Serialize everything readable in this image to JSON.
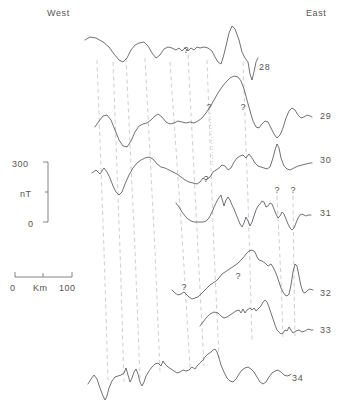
{
  "figure": {
    "type": "magnetic-anomaly-profiles",
    "orientation": {
      "west_label": "West",
      "east_label": "East"
    },
    "vertical_scale": {
      "top_value": "300",
      "unit_label": "nT",
      "bottom_value": "0"
    },
    "horizontal_scale": {
      "left_value": "0",
      "unit_label": "Km",
      "right_value": "100"
    },
    "colors": {
      "trace": "#4d4d55",
      "correlation_line": "#c2c2c2",
      "text": "#555555",
      "background": "#ffffff"
    },
    "profiles": [
      {
        "label": "28",
        "label_x": 259,
        "label_y": 62
      },
      {
        "label": "29",
        "label_x": 320,
        "label_y": 111
      },
      {
        "label": "30",
        "label_x": 320,
        "label_y": 155
      },
      {
        "label": "31",
        "label_x": 320,
        "label_y": 208
      },
      {
        "label": "32",
        "label_x": 320,
        "label_y": 288
      },
      {
        "label": "33",
        "label_x": 320,
        "label_y": 325
      },
      {
        "label": "34",
        "label_x": 292,
        "label_y": 373
      }
    ],
    "uncertainty_markers": [
      {
        "profile": "28",
        "x": 186,
        "y": 53
      },
      {
        "profile": "29",
        "x": 209,
        "y": 110
      },
      {
        "profile": "29",
        "x": 243,
        "y": 110
      },
      {
        "profile": "30",
        "x": 206,
        "y": 182
      },
      {
        "profile": "31",
        "x": 277,
        "y": 193
      },
      {
        "profile": "31",
        "x": 293,
        "y": 193
      },
      {
        "profile": "32",
        "x": 184,
        "y": 290
      },
      {
        "profile": "32",
        "x": 238,
        "y": 279
      }
    ]
  },
  "chart_data": {
    "type": "line",
    "title": "",
    "xlabel": "Km",
    "ylabel": "nT",
    "ylim": [
      0,
      300
    ],
    "xlim": [
      0,
      100
    ],
    "grid": false,
    "legend": "none",
    "annotations": [
      "West",
      "East",
      "?"
    ],
    "series": [
      {
        "name": "28",
        "x_start": 85,
        "x_end": 258,
        "baseline_y": 52,
        "points": "85,40 90,37 96,38 103,42 109,47 114,54 119,60 123,62 127,58 131,50 135,45 139,43 144,42 148,46 152,53 156,58 160,55 164,49 168,47 172,48 176,50 179,48 182,51 185,48 188,51 191,48 194,50 197,47 200,48 204,47 208,48 212,51 215,57 218,62 221,64 223,58 226,46 229,33 232,26 235,29 239,40 242,52 245,58 248,62 250,74 252,80 254,72 256,62 258,58"
      },
      {
        "name": "29",
        "x_start": 95,
        "x_end": 312,
        "baseline_y": 125,
        "points": "95,127 99,121 103,116 107,115 111,120 115,130 119,140 123,146 127,147 131,141 135,132 139,126 143,124 147,123 151,120 155,116 158,114 162,117 166,122 170,124 174,123 178,121 182,122 186,123 190,122 194,123 198,121 202,118 206,113 210,107 214,100 218,93 222,87 226,82 230,78 234,76 238,77 241,81 244,89 247,100 250,111 253,121 256,127 259,128 262,124 265,121 268,122 271,128 274,134 277,138 280,135 283,128 286,118 289,111 292,108 295,110 298,115 301,118 304,117 307,115 310,116 312,117"
      },
      {
        "name": "30",
        "x_start": 92,
        "x_end": 312,
        "baseline_y": 172,
        "points": "92,173 96,170 100,174 104,168 107,172 110,178 113,186 116,192 119,195 122,192 125,184 129,175 133,168 137,163 141,160 145,158 149,157 153,159 157,164 161,167 165,168 169,170 173,172 177,174 181,177 185,180 189,182 193,183 197,184 200,182 203,178 206,180 210,177 213,172 216,170 219,168 222,165 225,166 228,170 231,168 234,162 237,158 240,156 243,155 246,158 249,154 252,158 255,163 258,166 261,167 264,168 267,169 270,167 273,158 275,150 277,144 279,148 281,158 284,166 287,169 290,170 294,168 298,166 302,165 306,164 310,163 312,163"
      },
      {
        "name": "31",
        "x_start": 176,
        "x_end": 311,
        "baseline_y": 218,
        "points": "176,203 179,207 182,212 185,216 188,219 191,221 194,222 197,222 200,222 203,222 206,221 209,218 212,212 215,205 218,199 221,195 222,199 224,206 226,200 228,197 230,200 232,205 234,209 236,214 238,219 240,224 242,227 244,223 246,217 248,221 250,226 252,222 254,216 256,210 258,206 260,204 262,201 264,202 266,207 268,206 270,203 272,204 274,209 276,214 278,218 280,216 282,212 284,214 286,219 288,224 290,228 292,230 294,228 296,223 298,218 300,215 302,214 304,215 306,216 308,215 310,215 311,215"
      },
      {
        "name": "32",
        "x_start": 172,
        "x_end": 313,
        "baseline_y": 295,
        "points": "172,290 175,293 178,295 181,294 184,292 186,294 189,297 192,299 195,298 198,297 201,294 204,291 207,288 210,285 213,283 216,281 219,278 222,274 225,272 228,270 231,268 234,266 237,264 240,261 243,258 246,254 249,251 252,250 255,252 257,257 259,260 262,261 265,263 268,266 271,264 273,267 275,271 277,276 279,282 281,288 283,292 285,295 287,296 289,294 291,285 293,272 295,264 297,266 299,276 301,286 303,292 305,293 308,290 310,289 313,290"
      },
      {
        "name": "33",
        "x_start": 200,
        "x_end": 313,
        "baseline_y": 325,
        "points": "200,326 203,322 206,318 210,314 214,312 218,313 221,316 224,318 227,317 230,315 233,313 236,311 239,310 241,313 243,309 245,313 247,310 250,308 252,310 254,308 256,311 258,309 261,306 263,302 265,300 267,302 269,307 271,313 273,319 275,325 277,330 279,332 281,334 283,333 285,330 287,331 289,327 291,330 293,333 296,331 299,330 302,332 305,331 308,329 311,330 313,330"
      },
      {
        "name": "34",
        "x_start": 88,
        "x_end": 291,
        "baseline_y": 382,
        "points": "88,384 91,379 94,375 97,379 100,388 103,396 105,400 107,396 109,388 112,381 115,377 118,376 121,375 124,373 126,368 128,375 130,382 132,378 134,372 136,369 138,374 140,382 142,386 144,382 146,376 149,371 152,367 155,364 158,363 161,366 163,361 165,364 168,367 171,369 174,371 177,373 180,372 183,370 186,371 189,370 192,367 195,369 197,366 199,364 201,362 203,360 205,357 208,354 211,352 213,350 215,349 217,352 219,358 221,365 224,372 227,378 230,381 233,382 236,379 239,374 242,370 245,368 248,367 251,369 254,372 257,377 260,382 263,384 266,382 269,377 272,373 275,371 278,370 281,372 284,375 287,376 290,375 291,374"
      }
    ],
    "correlation_lines": [
      {
        "id": "c1",
        "path": "M 97,60 L 104,250 L 108,380"
      },
      {
        "id": "c2",
        "path": "M 113,62 L 120,250 L 124,382"
      },
      {
        "id": "c3",
        "path": "M 126,58 L 135,250 L 140,378"
      },
      {
        "id": "c4",
        "path": "M 145,58 L 155,250 L 160,372"
      },
      {
        "id": "c5",
        "path": "M 170,62 L 183,250 L 190,368"
      },
      {
        "id": "c6",
        "path": "M 188,55 L 198,250 L 204,366"
      },
      {
        "id": "c7",
        "path": "M 207,60 L 214,250 L 219,358"
      },
      {
        "id": "c8",
        "path": "M 243,62 L 248,200 L 252,340"
      },
      {
        "id": "c9",
        "path": "M 277,196 L 281,280 L 283,338"
      },
      {
        "id": "c10",
        "path": "M 293,196 L 294,280 L 295,336"
      }
    ],
    "dotted_lines": [
      {
        "id": "d1",
        "path": "M 210,113 L 213,165"
      }
    ]
  }
}
